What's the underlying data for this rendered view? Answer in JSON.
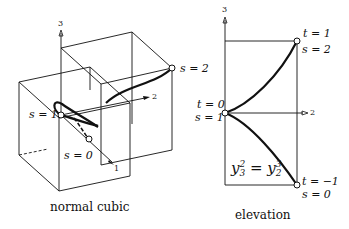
{
  "left_figure": {
    "caption": "normal cubic",
    "axis_labels": {
      "vertical": "3",
      "axis2": "2",
      "axis1": "1"
    },
    "points": {
      "s2": "s = 2",
      "s1": "s = 1",
      "s0": "s = 0"
    }
  },
  "right_figure": {
    "caption": "elevation",
    "axis_labels": {
      "vertical": "3",
      "horizontal": "2"
    },
    "points": {
      "top": {
        "t": "t = 1",
        "s": "s = 2"
      },
      "middle": {
        "t": "t = 0",
        "s": "s = 1"
      },
      "bottom": {
        "t": "t = −1",
        "s": "s = 0"
      }
    },
    "equation": {
      "lhs_base": "y",
      "lhs_sub": "3",
      "lhs_sup": "2",
      "eq": " = ",
      "rhs_base": "y",
      "rhs_sub": "2",
      "rhs_sup": "3"
    }
  }
}
